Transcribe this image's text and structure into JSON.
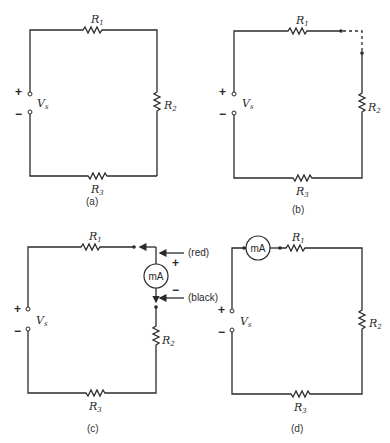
{
  "figure": {
    "panels": [
      {
        "id": "a",
        "caption": "(a)",
        "source": {
          "label": "V",
          "sub": "s",
          "plus": "+",
          "minus": "−"
        },
        "resistors": [
          {
            "label": "R",
            "sub": "1"
          },
          {
            "label": "R",
            "sub": "2"
          },
          {
            "label": "R",
            "sub": "3"
          }
        ]
      },
      {
        "id": "b",
        "caption": "(b)",
        "note": "Circuit opened between R1 and R2 (dashed connection)",
        "source": {
          "label": "V",
          "sub": "s",
          "plus": "+",
          "minus": "−"
        },
        "resistors": [
          {
            "label": "R",
            "sub": "1"
          },
          {
            "label": "R",
            "sub": "2"
          },
          {
            "label": "R",
            "sub": "3"
          }
        ]
      },
      {
        "id": "c",
        "caption": "(c)",
        "source": {
          "label": "V",
          "sub": "s",
          "plus": "+",
          "minus": "−"
        },
        "resistors": [
          {
            "label": "R",
            "sub": "1"
          },
          {
            "label": "R",
            "sub": "2"
          },
          {
            "label": "R",
            "sub": "3"
          }
        ],
        "meter": {
          "label": "mA",
          "plus": "+",
          "minus": "−",
          "lead_plus": "(red)",
          "lead_minus": "(black)"
        }
      },
      {
        "id": "d",
        "caption": "(d)",
        "source": {
          "label": "V",
          "sub": "s",
          "plus": "+",
          "minus": "−"
        },
        "resistors": [
          {
            "label": "R",
            "sub": "1"
          },
          {
            "label": "R",
            "sub": "2"
          },
          {
            "label": "R",
            "sub": "3"
          }
        ],
        "meter": {
          "label": "mA"
        }
      }
    ]
  }
}
